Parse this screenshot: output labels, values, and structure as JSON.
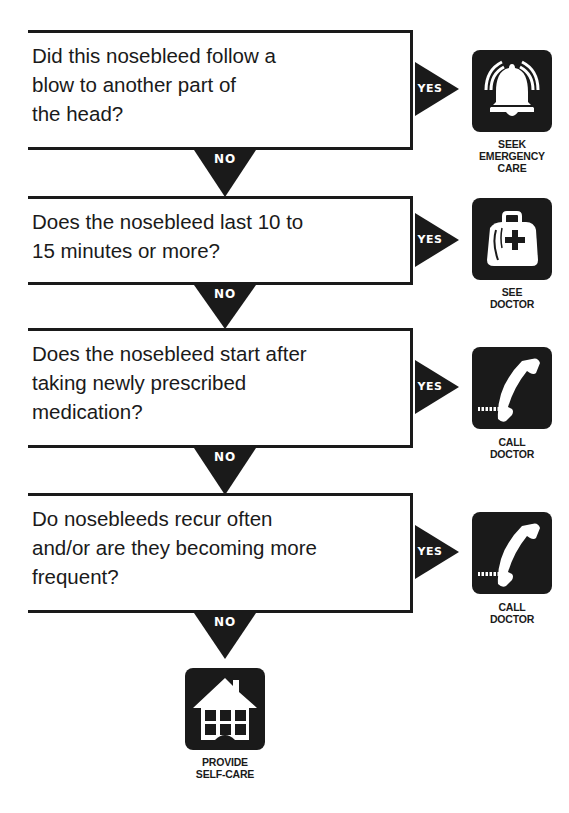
{
  "flowchart": {
    "questions": [
      {
        "text": "Did this nosebleed follow a blow to another part of the head?",
        "lines": [
          "Did this nosebleed follow a",
          "blow to another part of",
          "the head?"
        ]
      },
      {
        "text": "Does the nosebleed last 10 to 15 minutes or more?",
        "lines": [
          "Does the nosebleed last 10 to",
          "15 minutes or more?"
        ]
      },
      {
        "text": "Does the nosebleed start after taking newly prescribed medication?",
        "lines": [
          "Does the nosebleed start after",
          "taking newly prescribed",
          "medication?"
        ]
      },
      {
        "text": "Do nosebleeds recur often and/or are they becoming more frequent?",
        "lines": [
          "Do nosebleeds recur often",
          "and/or are they becoming more",
          "frequent?"
        ]
      }
    ],
    "yes_label": "YES",
    "no_label": "NO",
    "outcomes": [
      {
        "icon": "bell-icon",
        "lines": [
          "SEEK",
          "EMERGENCY",
          "CARE"
        ]
      },
      {
        "icon": "medical-bag-icon",
        "lines": [
          "SEE",
          "DOCTOR"
        ]
      },
      {
        "icon": "telephone-icon",
        "lines": [
          "CALL",
          "DOCTOR"
        ]
      },
      {
        "icon": "telephone-icon",
        "lines": [
          "CALL",
          "DOCTOR"
        ]
      }
    ],
    "final": {
      "icon": "house-icon",
      "lines": [
        "PROVIDE",
        "SELF-CARE"
      ]
    }
  },
  "colors": {
    "ink": "#1a1a1a",
    "paper": "#ffffff"
  }
}
